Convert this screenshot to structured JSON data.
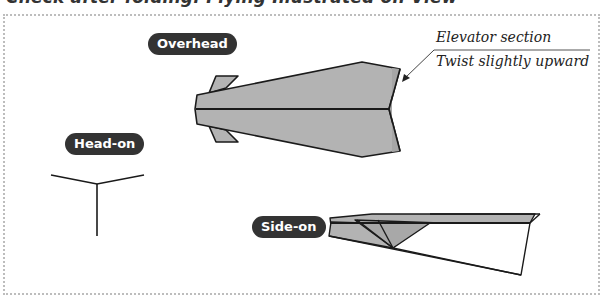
{
  "title": "Check after folding: Flying Illustrated on View",
  "views": {
    "overhead": {
      "label": "Overhead"
    },
    "head_on": {
      "label": "Head-on"
    },
    "side_on": {
      "label": "Side-on"
    }
  },
  "annotation": {
    "line1": "Elevator section",
    "line2": "Twist slightly upward"
  },
  "colors": {
    "fill": "#b3b3b3",
    "stroke": "#1a1a1a",
    "pill_bg": "#333333",
    "pill_text": "#ffffff",
    "frame_border": "#bdbdbd"
  }
}
